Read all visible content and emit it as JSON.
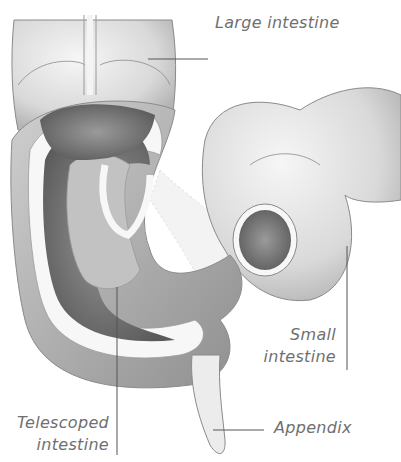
{
  "diagram": {
    "colors": {
      "background": "#ffffff",
      "tissue_light": "#e6e6e6",
      "tissue_mid": "#bdbdbd",
      "tissue_dark": "#6e6e6e",
      "outline": "#8a8a8a",
      "wall": "#f7f7f7",
      "label_text": "#6f6f6f",
      "leader_line": "#555555"
    },
    "labels": {
      "large_intestine": "Large intestine",
      "small_intestine_line1": "Small",
      "small_intestine_line2": "intestine",
      "telescoped_line1": "Telescoped",
      "telescoped_line2": "intestine",
      "appendix": "Appendix"
    }
  }
}
